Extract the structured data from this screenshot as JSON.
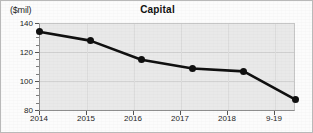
{
  "chart_data": {
    "type": "line",
    "title": "Capital",
    "ylabel": "($mil)",
    "xlabel": "",
    "categories": [
      "2014",
      "2015",
      "2016",
      "2017",
      "2018",
      "9-19"
    ],
    "values": [
      134,
      128,
      115,
      109,
      107,
      88
    ],
    "ylim": [
      80,
      140
    ],
    "yticks": [
      80,
      100,
      120,
      140
    ],
    "ytick_labels": [
      "80",
      "100",
      "120",
      "140"
    ],
    "y_minor_interval": 5,
    "grid": true,
    "legend": "none",
    "series": [
      {
        "name": "Capital",
        "values": [
          134,
          128,
          115,
          109,
          107,
          88
        ]
      }
    ],
    "marker": "filled-circle",
    "line_color": "#101010",
    "plot_background": "#e9e9e9",
    "page_background": "#fcfcfc"
  },
  "axis": {
    "y_label_text": "($mil)",
    "y_tick_0": "140",
    "y_tick_1": "120",
    "y_tick_2": "100",
    "y_tick_3": "80",
    "x_tick_0": "2014",
    "x_tick_1": "2015",
    "x_tick_2": "2016",
    "x_tick_3": "2017",
    "x_tick_4": "2018",
    "x_tick_5": "9-19"
  }
}
